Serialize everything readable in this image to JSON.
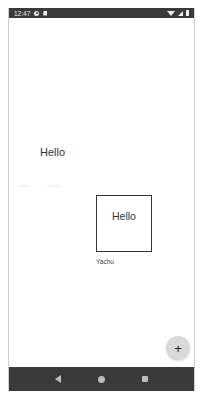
{
  "status_bar": {
    "time": "12:47",
    "icons": [
      "gear-icon",
      "sd-card-icon",
      "wifi-icon",
      "signal-icon",
      "battery-icon"
    ]
  },
  "content": {
    "hello_text": "Hello",
    "card": {
      "text": "Hello",
      "caption": "Yachu"
    }
  },
  "fab": {
    "icon": "plus-icon",
    "label": "+"
  },
  "nav_bar": {
    "buttons": [
      "back",
      "home",
      "recents"
    ]
  },
  "colors": {
    "status_bar_bg": "#3a3a3a",
    "nav_bar_bg": "#3a3a3a",
    "fab_bg": "#d9d9d9",
    "text": "#333333"
  }
}
